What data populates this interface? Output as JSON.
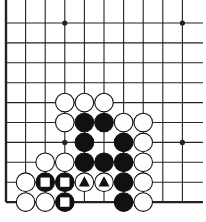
{
  "diagram": {
    "type": "go-board-fragment",
    "columns": 10,
    "rows": 10,
    "origin_x": 6,
    "origin_y": 23,
    "spacing_x": 19.6,
    "spacing_y": 19.9,
    "edges": [
      "left",
      "bottom"
    ],
    "star_points": [
      [
        3,
        0
      ],
      [
        9,
        0
      ],
      [
        3,
        6
      ],
      [
        9,
        6
      ]
    ],
    "colors": {
      "black": "#111111",
      "white": "#ffffff",
      "line": "#222222"
    },
    "stones": [
      {
        "col": 3,
        "row": 4,
        "color": "white"
      },
      {
        "col": 4,
        "row": 4,
        "color": "white"
      },
      {
        "col": 5,
        "row": 4,
        "color": "white"
      },
      {
        "col": 3,
        "row": 5,
        "color": "white"
      },
      {
        "col": 4,
        "row": 5,
        "color": "black"
      },
      {
        "col": 5,
        "row": 5,
        "color": "black"
      },
      {
        "col": 6,
        "row": 5,
        "color": "white"
      },
      {
        "col": 7,
        "row": 5,
        "color": "white"
      },
      {
        "col": 4,
        "row": 6,
        "color": "black"
      },
      {
        "col": 6,
        "row": 6,
        "color": "black"
      },
      {
        "col": 7,
        "row": 6,
        "color": "white"
      },
      {
        "col": 2,
        "row": 7,
        "color": "white"
      },
      {
        "col": 3,
        "row": 7,
        "color": "white"
      },
      {
        "col": 4,
        "row": 7,
        "color": "black"
      },
      {
        "col": 5,
        "row": 7,
        "color": "black"
      },
      {
        "col": 6,
        "row": 7,
        "color": "black"
      },
      {
        "col": 7,
        "row": 7,
        "color": "white"
      },
      {
        "col": 1,
        "row": 8,
        "color": "white"
      },
      {
        "col": 2,
        "row": 8,
        "color": "black",
        "mark": "square"
      },
      {
        "col": 3,
        "row": 8,
        "color": "black",
        "mark": "square"
      },
      {
        "col": 4,
        "row": 8,
        "color": "white",
        "mark": "triangle"
      },
      {
        "col": 5,
        "row": 8,
        "color": "white",
        "mark": "triangle"
      },
      {
        "col": 6,
        "row": 8,
        "color": "black"
      },
      {
        "col": 7,
        "row": 8,
        "color": "white"
      },
      {
        "col": 1,
        "row": 9,
        "color": "white"
      },
      {
        "col": 2,
        "row": 9,
        "color": "white"
      },
      {
        "col": 3,
        "row": 9,
        "color": "black",
        "mark": "square"
      },
      {
        "col": 6,
        "row": 9,
        "color": "black"
      },
      {
        "col": 7,
        "row": 9,
        "color": "white"
      }
    ]
  }
}
